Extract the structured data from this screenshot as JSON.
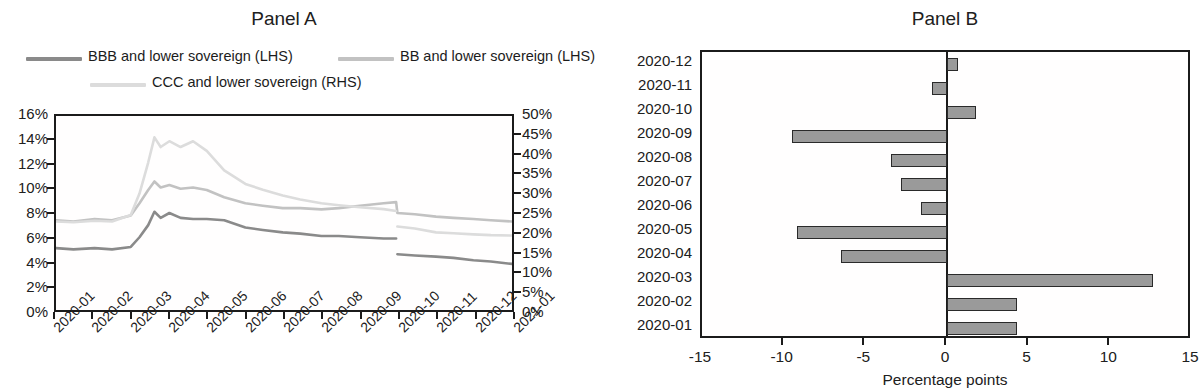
{
  "panelA": {
    "title": "Panel A",
    "legend": [
      {
        "label": "BBB and lower sovereign (LHS)",
        "color": "#8a8a8a"
      },
      {
        "label": "BB and lower sovereign (LHS)",
        "color": "#c2c2c2"
      },
      {
        "label": "CCC and lower sovereign (RHS)",
        "color": "#dcdcdc"
      }
    ]
  },
  "panelB": {
    "title": "Panel B",
    "xlabel": "Percentage points"
  },
  "chart_data": [
    {
      "type": "line",
      "title": "Panel A",
      "xlabel": "",
      "ylabel": "",
      "grid": false,
      "legend_position": "top",
      "xlim": [
        "2020-01",
        "2021-01"
      ],
      "xticks": [
        "2020-01",
        "2020-02",
        "2020-03",
        "2020-04",
        "2020-05",
        "2020-06",
        "2020-07",
        "2020-08",
        "2020-09",
        "2020-10",
        "2020-11",
        "2020-12",
        "2021-01"
      ],
      "left_axis": {
        "ylim": [
          0,
          16
        ],
        "yticks": [
          0,
          2,
          4,
          6,
          8,
          10,
          12,
          14,
          16
        ],
        "yticklabels": [
          "0%",
          "2%",
          "4%",
          "6%",
          "8%",
          "10%",
          "12%",
          "14%",
          "16%"
        ]
      },
      "right_axis": {
        "ylim": [
          0,
          50
        ],
        "yticks": [
          0,
          5,
          10,
          15,
          20,
          25,
          30,
          35,
          40,
          45,
          50
        ],
        "yticklabels": [
          "0%",
          "5%",
          "10%",
          "15%",
          "20%",
          "25%",
          "30%",
          "35%",
          "40%",
          "45%",
          "50%"
        ]
      },
      "series": [
        {
          "name": "BBB and lower sovereign (LHS)",
          "axis": "left",
          "color": "#8a8a8a",
          "x": [
            "2020-01-01",
            "2020-01-15",
            "2020-02-01",
            "2020-02-15",
            "2020-03-01",
            "2020-03-08",
            "2020-03-15",
            "2020-03-20",
            "2020-03-25",
            "2020-04-01",
            "2020-04-10",
            "2020-04-20",
            "2020-05-01",
            "2020-05-15",
            "2020-06-01",
            "2020-06-15",
            "2020-07-01",
            "2020-07-15",
            "2020-08-01",
            "2020-08-15",
            "2020-09-01",
            "2020-09-20",
            "2020-09-30",
            "2020-10-01",
            "2020-10-15",
            "2020-11-01",
            "2020-11-15",
            "2020-12-01",
            "2020-12-15",
            "2021-01-01"
          ],
          "y": [
            5.1,
            5.0,
            5.1,
            5.0,
            5.2,
            6.0,
            7.0,
            8.1,
            7.6,
            8.0,
            7.6,
            7.5,
            7.5,
            7.4,
            6.8,
            6.6,
            6.4,
            6.3,
            6.1,
            6.1,
            6.0,
            5.9,
            5.9,
            4.6,
            4.5,
            4.4,
            4.3,
            4.1,
            4.0,
            3.8
          ]
        },
        {
          "name": "BB and lower sovereign (LHS)",
          "axis": "left",
          "color": "#c2c2c2",
          "x": [
            "2020-01-01",
            "2020-01-15",
            "2020-02-01",
            "2020-02-15",
            "2020-03-01",
            "2020-03-08",
            "2020-03-15",
            "2020-03-20",
            "2020-03-25",
            "2020-04-01",
            "2020-04-10",
            "2020-04-20",
            "2020-05-01",
            "2020-05-15",
            "2020-06-01",
            "2020-06-15",
            "2020-07-01",
            "2020-07-15",
            "2020-08-01",
            "2020-08-15",
            "2020-09-01",
            "2020-09-20",
            "2020-09-30",
            "2020-10-01",
            "2020-10-15",
            "2020-11-01",
            "2020-11-15",
            "2020-12-01",
            "2020-12-15",
            "2021-01-01"
          ],
          "y": [
            7.4,
            7.3,
            7.5,
            7.4,
            7.8,
            8.8,
            9.9,
            10.6,
            10.1,
            10.3,
            10.0,
            10.1,
            9.9,
            9.3,
            8.8,
            8.6,
            8.4,
            8.4,
            8.3,
            8.4,
            8.6,
            8.8,
            8.9,
            8.0,
            7.9,
            7.7,
            7.6,
            7.5,
            7.4,
            7.3
          ]
        },
        {
          "name": "CCC and lower sovereign (RHS)",
          "axis": "right",
          "color": "#dcdcdc",
          "x": [
            "2020-01-01",
            "2020-01-15",
            "2020-02-01",
            "2020-02-15",
            "2020-03-01",
            "2020-03-08",
            "2020-03-15",
            "2020-03-20",
            "2020-03-25",
            "2020-04-01",
            "2020-04-10",
            "2020-04-20",
            "2020-05-01",
            "2020-05-15",
            "2020-06-01",
            "2020-06-15",
            "2020-07-01",
            "2020-07-15",
            "2020-08-01",
            "2020-08-15",
            "2020-09-01",
            "2020-09-20",
            "2020-09-30",
            "2020-10-01",
            "2020-10-15",
            "2020-11-01",
            "2020-11-15",
            "2020-12-01",
            "2020-12-15",
            "2021-01-01"
          ],
          "y": [
            22.8,
            22.6,
            23.0,
            22.8,
            24.5,
            30.0,
            38.0,
            44.5,
            42.0,
            43.5,
            42.0,
            43.5,
            41.0,
            36.0,
            32.5,
            31.0,
            29.5,
            28.5,
            27.5,
            27.0,
            26.5,
            26.0,
            25.5,
            21.5,
            21.0,
            20.0,
            19.8,
            19.5,
            19.3,
            19.2
          ]
        }
      ]
    },
    {
      "type": "bar",
      "orientation": "horizontal",
      "title": "Panel B",
      "xlabel": "Percentage points",
      "ylabel": "",
      "grid": false,
      "bar_color": "#9a9a9a",
      "bar_edge_color": "#2a2a2a",
      "xlim": [
        -15,
        15
      ],
      "xticks": [
        -15,
        -10,
        -5,
        0,
        5,
        10,
        15
      ],
      "xticklabels": [
        "-15",
        "-10",
        "-5",
        "0",
        "5",
        "10",
        "15"
      ],
      "categories": [
        "2020-12",
        "2020-11",
        "2020-10",
        "2020-09",
        "2020-08",
        "2020-07",
        "2020-06",
        "2020-05",
        "2020-04",
        "2020-03",
        "2020-02",
        "2020-01"
      ],
      "values": [
        0.7,
        -0.9,
        1.8,
        -9.5,
        -3.4,
        -2.8,
        -1.6,
        -9.2,
        -6.5,
        12.6,
        4.3,
        4.3
      ]
    }
  ]
}
